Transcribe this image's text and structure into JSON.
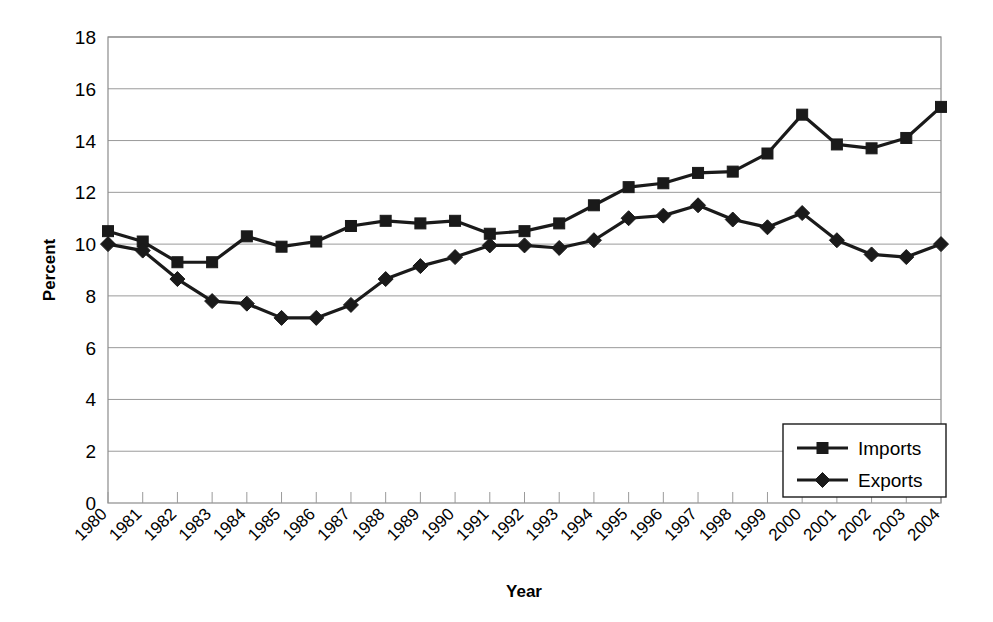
{
  "chart_data": {
    "type": "line",
    "title": "",
    "xlabel": "Year",
    "ylabel": "Percent",
    "grid": true,
    "legend_position": "bottom-right",
    "ylim": [
      0,
      18
    ],
    "yticks": [
      0,
      2,
      4,
      6,
      8,
      10,
      12,
      14,
      16,
      18
    ],
    "ytick_labels": [
      "0",
      "2",
      "4",
      "6",
      "8",
      "10",
      "12",
      "14",
      "16",
      "18"
    ],
    "categories": [
      "1980",
      "1981",
      "1982",
      "1983",
      "1984",
      "1985",
      "1986",
      "1987",
      "1988",
      "1989",
      "1990",
      "1991",
      "1992",
      "1993",
      "1994",
      "1995",
      "1996",
      "1997",
      "1998",
      "1999",
      "2000",
      "2001",
      "2002",
      "2003",
      "2004"
    ],
    "series": [
      {
        "name": "Imports",
        "marker": "square",
        "color": "#1a1a1a",
        "values": [
          10.5,
          10.1,
          9.3,
          9.3,
          10.3,
          9.9,
          10.1,
          10.7,
          10.9,
          10.8,
          10.9,
          10.4,
          10.5,
          10.8,
          11.5,
          12.2,
          12.35,
          12.75,
          12.8,
          13.5,
          15.0,
          13.85,
          13.7,
          14.1,
          15.3
        ]
      },
      {
        "name": "Exports",
        "marker": "diamond",
        "color": "#1a1a1a",
        "values": [
          10.0,
          9.75,
          8.65,
          7.8,
          7.7,
          7.15,
          7.15,
          7.65,
          8.65,
          9.15,
          9.5,
          9.95,
          9.95,
          9.85,
          10.15,
          11.0,
          11.1,
          11.5,
          10.95,
          10.65,
          11.2,
          10.15,
          9.6,
          9.5,
          10.0
        ]
      }
    ]
  },
  "legend": {
    "items": [
      {
        "label": "Imports",
        "marker": "square"
      },
      {
        "label": "Exports",
        "marker": "diamond"
      }
    ]
  },
  "axes": {
    "y_title": "Percent",
    "x_title": "Year"
  },
  "colors": {
    "series": "#1a1a1a",
    "grid": "#9a9a9a",
    "frame": "#8c8c8c",
    "background": "#ffffff"
  }
}
